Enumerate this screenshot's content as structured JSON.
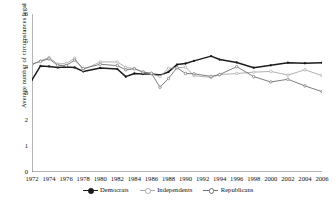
{
  "chart_data": {
    "type": "line",
    "title": "",
    "xlabel": "",
    "ylabel": "Average number of circumstances legal",
    "ylim": [
      0,
      6
    ],
    "yticks": [
      0,
      1,
      2,
      3,
      4,
      5,
      6
    ],
    "xlim": [
      1972,
      2006
    ],
    "xticks": [
      1972,
      1974,
      1976,
      1978,
      1980,
      1982,
      1984,
      1986,
      1988,
      1990,
      1992,
      1994,
      1996,
      1998,
      2000,
      2002,
      2004,
      2006
    ],
    "grid": false,
    "legend_position": "bottom",
    "x": [
      1972,
      1973,
      1974,
      1975,
      1976,
      1977,
      1978,
      1980,
      1982,
      1983,
      1984,
      1985,
      1986,
      1987,
      1988,
      1989,
      1990,
      1991,
      1993,
      1994,
      1996,
      1998,
      2000,
      2002,
      2004,
      2006
    ],
    "series": [
      {
        "name": "Democrats",
        "color": "#1c1c1c",
        "values": [
          3.5,
          4.03,
          4.01,
          3.97,
          3.99,
          3.97,
          3.82,
          3.95,
          3.91,
          3.62,
          3.74,
          3.72,
          3.72,
          3.68,
          3.8,
          4.08,
          4.12,
          4.22,
          4.4,
          4.27,
          4.16,
          3.96,
          4.05,
          4.15,
          4.13,
          4.15
        ]
      },
      {
        "name": "Independents",
        "color": "#a8a8a8",
        "values": [
          4.08,
          4.22,
          4.35,
          4.1,
          4.12,
          4.32,
          3.88,
          4.18,
          4.18,
          3.97,
          3.93,
          3.79,
          3.73,
          3.62,
          3.94,
          3.96,
          3.98,
          3.66,
          3.59,
          3.7,
          3.74,
          3.79,
          3.82,
          3.68,
          3.88,
          3.66
        ]
      },
      {
        "name": "Republicans",
        "color": "#6f6f6f",
        "values": [
          4.1,
          4.2,
          4.3,
          4.05,
          4.04,
          4.25,
          3.93,
          4.09,
          4.04,
          3.88,
          3.92,
          3.8,
          3.75,
          3.22,
          3.55,
          3.96,
          3.74,
          3.73,
          3.63,
          3.7,
          4.0,
          3.62,
          3.42,
          3.52,
          3.27,
          3.05
        ]
      }
    ]
  },
  "axis": {
    "ytick_labels": [
      "6",
      "5",
      "4",
      "3",
      "2",
      "1",
      "0"
    ],
    "xtick_labels": [
      "1972",
      "1974",
      "1976",
      "1978",
      "1980",
      "1982",
      "1984",
      "1986",
      "1988",
      "1990",
      "1992",
      "1994",
      "1996",
      "1998",
      "2000",
      "2002",
      "2004",
      "2006"
    ]
  },
  "legend": {
    "items": [
      {
        "label": "Democrats",
        "color": "#1c1c1c"
      },
      {
        "label": "Independents",
        "color": "#a8a8a8"
      },
      {
        "label": "Republicans",
        "color": "#6f6f6f"
      }
    ]
  }
}
